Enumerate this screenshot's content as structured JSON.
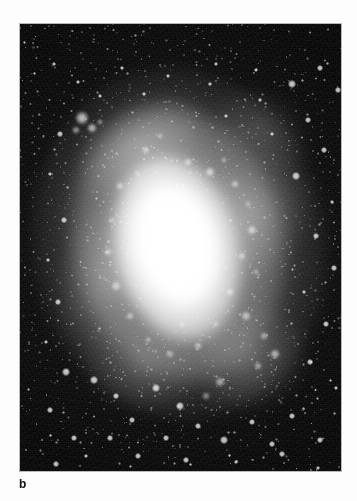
{
  "figure": {
    "panel_label": "b",
    "medium": "grayscale astronomical photograph",
    "background_color": "#fdfdfd",
    "plate_color": "#050505",
    "ink_color": "#111111"
  },
  "plate": {
    "x": 20,
    "y": 24,
    "width": 321,
    "height": 447,
    "border_color": "#b9b9b9"
  },
  "galaxy": {
    "type": "barred spiral",
    "core_center_x": 156,
    "core_center_y": 220,
    "position_angle_deg": -13,
    "core_color": "#ffffff",
    "halo_color": "#e8e8e8",
    "sky_color": "#0a0a0a"
  },
  "knots": [
    {
      "x": 62,
      "y": 94,
      "r": 7,
      "i": 0.95
    },
    {
      "x": 72,
      "y": 104,
      "r": 5,
      "i": 0.88
    },
    {
      "x": 56,
      "y": 106,
      "r": 4,
      "i": 0.72
    },
    {
      "x": 80,
      "y": 98,
      "r": 3,
      "i": 0.66
    },
    {
      "x": 126,
      "y": 126,
      "r": 4,
      "i": 0.7
    },
    {
      "x": 140,
      "y": 112,
      "r": 3,
      "i": 0.62
    },
    {
      "x": 168,
      "y": 138,
      "r": 4,
      "i": 0.74
    },
    {
      "x": 190,
      "y": 148,
      "r": 5,
      "i": 0.8
    },
    {
      "x": 204,
      "y": 136,
      "r": 3,
      "i": 0.6
    },
    {
      "x": 215,
      "y": 160,
      "r": 4,
      "i": 0.7
    },
    {
      "x": 228,
      "y": 180,
      "r": 3,
      "i": 0.58
    },
    {
      "x": 232,
      "y": 206,
      "r": 5,
      "i": 0.78
    },
    {
      "x": 222,
      "y": 232,
      "r": 4,
      "i": 0.66
    },
    {
      "x": 236,
      "y": 248,
      "r": 3,
      "i": 0.6
    },
    {
      "x": 210,
      "y": 268,
      "r": 4,
      "i": 0.7
    },
    {
      "x": 226,
      "y": 292,
      "r": 5,
      "i": 0.76
    },
    {
      "x": 244,
      "y": 312,
      "r": 4,
      "i": 0.68
    },
    {
      "x": 255,
      "y": 330,
      "r": 5,
      "i": 0.82
    },
    {
      "x": 238,
      "y": 342,
      "r": 4,
      "i": 0.64
    },
    {
      "x": 100,
      "y": 162,
      "r": 4,
      "i": 0.7
    },
    {
      "x": 92,
      "y": 196,
      "r": 3,
      "i": 0.6
    },
    {
      "x": 88,
      "y": 228,
      "r": 4,
      "i": 0.66
    },
    {
      "x": 96,
      "y": 262,
      "r": 5,
      "i": 0.74
    },
    {
      "x": 110,
      "y": 292,
      "r": 4,
      "i": 0.68
    },
    {
      "x": 128,
      "y": 316,
      "r": 3,
      "i": 0.58
    },
    {
      "x": 150,
      "y": 330,
      "r": 4,
      "i": 0.64
    },
    {
      "x": 178,
      "y": 322,
      "r": 4,
      "i": 0.66
    },
    {
      "x": 196,
      "y": 300,
      "r": 3,
      "i": 0.56
    },
    {
      "x": 162,
      "y": 300,
      "r": 3,
      "i": 0.54
    },
    {
      "x": 118,
      "y": 150,
      "r": 3,
      "i": 0.55
    },
    {
      "x": 200,
      "y": 358,
      "r": 5,
      "i": 0.72
    },
    {
      "x": 186,
      "y": 372,
      "r": 4,
      "i": 0.62
    }
  ],
  "stars": [
    {
      "x": 272,
      "y": 60,
      "r": 3.0
    },
    {
      "x": 300,
      "y": 44,
      "r": 2.2
    },
    {
      "x": 318,
      "y": 66,
      "r": 2.0
    },
    {
      "x": 236,
      "y": 46,
      "r": 1.8
    },
    {
      "x": 196,
      "y": 40,
      "r": 1.6
    },
    {
      "x": 148,
      "y": 52,
      "r": 1.8
    },
    {
      "x": 102,
      "y": 44,
      "r": 1.6
    },
    {
      "x": 58,
      "y": 58,
      "r": 1.8
    },
    {
      "x": 34,
      "y": 40,
      "r": 1.5
    },
    {
      "x": 288,
      "y": 96,
      "r": 2.4
    },
    {
      "x": 304,
      "y": 126,
      "r": 2.0
    },
    {
      "x": 276,
      "y": 152,
      "r": 3.2
    },
    {
      "x": 312,
      "y": 178,
      "r": 1.8
    },
    {
      "x": 296,
      "y": 212,
      "r": 2.6
    },
    {
      "x": 314,
      "y": 244,
      "r": 2.0
    },
    {
      "x": 284,
      "y": 268,
      "r": 1.8
    },
    {
      "x": 306,
      "y": 300,
      "r": 2.4
    },
    {
      "x": 290,
      "y": 338,
      "r": 2.0
    },
    {
      "x": 316,
      "y": 364,
      "r": 1.8
    },
    {
      "x": 272,
      "y": 392,
      "r": 2.6
    },
    {
      "x": 300,
      "y": 416,
      "r": 2.2
    },
    {
      "x": 40,
      "y": 110,
      "r": 2.0
    },
    {
      "x": 30,
      "y": 150,
      "r": 1.8
    },
    {
      "x": 44,
      "y": 196,
      "r": 2.2
    },
    {
      "x": 28,
      "y": 236,
      "r": 1.6
    },
    {
      "x": 38,
      "y": 278,
      "r": 2.4
    },
    {
      "x": 26,
      "y": 318,
      "r": 1.8
    },
    {
      "x": 46,
      "y": 348,
      "r": 2.8
    },
    {
      "x": 30,
      "y": 386,
      "r": 2.0
    },
    {
      "x": 54,
      "y": 414,
      "r": 2.4
    },
    {
      "x": 74,
      "y": 356,
      "r": 3.0
    },
    {
      "x": 96,
      "y": 372,
      "r": 2.2
    },
    {
      "x": 112,
      "y": 396,
      "r": 2.6
    },
    {
      "x": 90,
      "y": 414,
      "r": 2.0
    },
    {
      "x": 136,
      "y": 364,
      "r": 2.8
    },
    {
      "x": 160,
      "y": 382,
      "r": 3.4
    },
    {
      "x": 178,
      "y": 402,
      "r": 2.6
    },
    {
      "x": 146,
      "y": 414,
      "r": 2.2
    },
    {
      "x": 204,
      "y": 416,
      "r": 3.0
    },
    {
      "x": 232,
      "y": 398,
      "r": 2.4
    },
    {
      "x": 252,
      "y": 420,
      "r": 2.0
    },
    {
      "x": 118,
      "y": 432,
      "r": 2.4
    },
    {
      "x": 166,
      "y": 436,
      "r": 2.0
    },
    {
      "x": 216,
      "y": 438,
      "r": 1.8
    },
    {
      "x": 262,
      "y": 430,
      "r": 2.2
    },
    {
      "x": 66,
      "y": 432,
      "r": 1.8
    },
    {
      "x": 36,
      "y": 440,
      "r": 2.0
    },
    {
      "x": 298,
      "y": 444,
      "r": 1.6
    },
    {
      "x": 190,
      "y": 60,
      "r": 1.4
    },
    {
      "x": 252,
      "y": 110,
      "r": 1.6
    },
    {
      "x": 240,
      "y": 76,
      "r": 1.5
    },
    {
      "x": 124,
      "y": 70,
      "r": 1.4
    },
    {
      "x": 80,
      "y": 72,
      "r": 1.5
    },
    {
      "x": 206,
      "y": 92,
      "r": 1.5
    }
  ]
}
